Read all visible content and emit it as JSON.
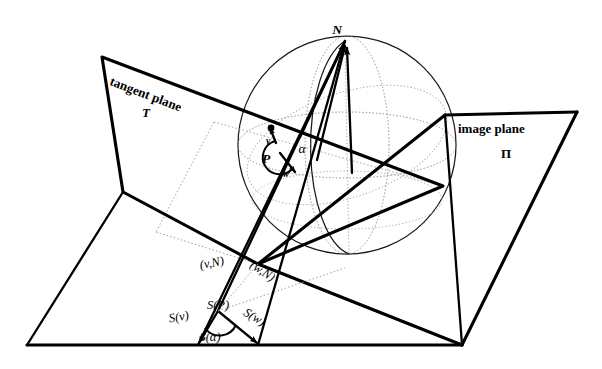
{
  "figure": {
    "kind": "geometric-diagram",
    "background_color": "#ffffff",
    "ink_color": "#000000",
    "hidden_line_color": "#9a9a9a"
  },
  "labels": {
    "tangent_plane_title": "tangent plane",
    "tangent_plane_symbol": "T",
    "image_plane_title": "image plane",
    "image_plane_symbol": "Π",
    "north_pole": "N",
    "point_p": "P",
    "vector_v": "v",
    "vector_w": "w",
    "angle_alpha": "α",
    "line_v_N": "(v,N)",
    "line_w_N": "(w,N)",
    "proj_point": "S(P)",
    "proj_v": "S(v)",
    "proj_w": "S(w)",
    "proj_angle": "S(α)"
  },
  "geometry": {
    "sphere": {
      "center_x": 347,
      "center_y": 145,
      "radius": 109
    },
    "north_pole_point": {
      "x": 345,
      "y": 41
    },
    "point_p": {
      "x": 271,
      "y": 131
    },
    "proj_point": {
      "x": 218,
      "y": 311
    },
    "baseline_y": 345,
    "tangent_plane_quad": "102,57 443,186 258,264 123,192",
    "image_plane_quad": "445,115 577,112 462,345 258,264"
  }
}
